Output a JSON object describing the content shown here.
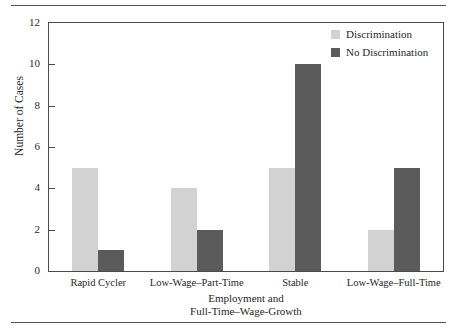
{
  "chart_data": {
    "type": "bar",
    "title": "",
    "xlabel": "Employment and Full-Time–Wage-Growth",
    "xlabel_line1": "Employment and",
    "xlabel_line2": "Full-Time–Wage-Growth",
    "ylabel": "Number of Cases",
    "categories": [
      "Rapid Cycler",
      "Low-Wage–Part-Time",
      "Stable",
      "Low-Wage–Full-Time"
    ],
    "series": [
      {
        "name": "Discrimination",
        "values": [
          5,
          4,
          5,
          2
        ],
        "color": "#d2d2d2"
      },
      {
        "name": "No Discrimination",
        "values": [
          1,
          2,
          10,
          5
        ],
        "color": "#5b5b5b"
      }
    ],
    "ylim": [
      0,
      12
    ],
    "yticks": [
      0,
      2,
      4,
      6,
      8,
      10,
      12
    ],
    "ytick_labels": [
      "0",
      "2",
      "4",
      "6",
      "8",
      "10",
      "12"
    ],
    "grid": false,
    "legend_position": "top-right",
    "legend_entries": [
      "Discrimination",
      "No Discrimination"
    ]
  },
  "figure": {
    "rule_top_name": "top-divider-rule",
    "rule_bottom_name": "bottom-divider-rule"
  }
}
